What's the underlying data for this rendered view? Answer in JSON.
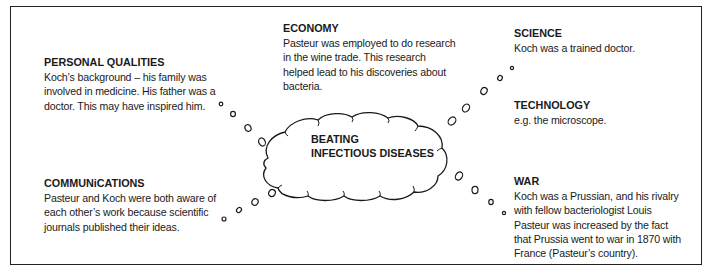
{
  "diagram": {
    "center": {
      "label": "BEATING\nINFECTIOUS DISEASES"
    },
    "nodes": [
      {
        "id": "economy",
        "title": "ECONOMY",
        "body": "Pasteur was employed to do research\nin the wine trade. This research\nhelped lead to his discoveries about\nbacteria."
      },
      {
        "id": "personal-qualities",
        "title": "PERSONAL QUALITIES",
        "body": "Koch’s background – his family was\ninvolved in medicine. His father was a\ndoctor. This may have inspired him."
      },
      {
        "id": "science",
        "title": "SCIENCE",
        "body": "Koch was a trained doctor."
      },
      {
        "id": "technology",
        "title": "TECHNOLOGY",
        "body": "e.g. the microscope."
      },
      {
        "id": "communications",
        "title": "COMMUNiCATIONS",
        "body": "Pasteur and Koch were both aware of\neach other’s work because scientific\njournals published their ideas."
      },
      {
        "id": "war",
        "title": "WAR",
        "body": "Koch was a Prussian, and his rivalry\nwith fellow bacteriologist Louis\nPasteur was increased by the fact\nthat Prussia went to war in 1870 with\nFrance (Pasteur’s country)."
      }
    ]
  }
}
